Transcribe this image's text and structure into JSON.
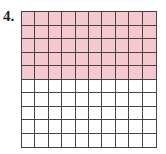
{
  "problem": {
    "number_label": "4.",
    "grid": {
      "rows": 10,
      "cols": 10,
      "shaded_rows": 5,
      "shaded_cells": 50,
      "total_cells": 100,
      "shade_color": "#f5c8d0",
      "line_color": "#444444"
    }
  }
}
